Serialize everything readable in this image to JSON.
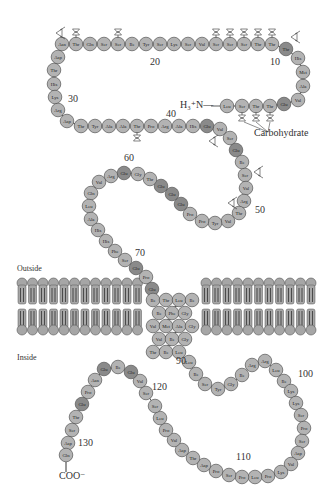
{
  "labels": {
    "outside": "Outside",
    "inside": "Inside",
    "n_terminus": "H₃⁺N—",
    "c_terminus": "COO⁻",
    "carbohydrate": "Carbohydrate"
  },
  "numbers": [
    {
      "text": "10",
      "x": 270,
      "y": 62
    },
    {
      "text": "20",
      "x": 150,
      "y": 62
    },
    {
      "text": "30",
      "x": 68,
      "y": 99
    },
    {
      "text": "40",
      "x": 166,
      "y": 114
    },
    {
      "text": "50",
      "x": 255,
      "y": 210
    },
    {
      "text": "60",
      "x": 124,
      "y": 158
    },
    {
      "text": "70",
      "x": 135,
      "y": 253
    },
    {
      "text": "90",
      "x": 176,
      "y": 361
    },
    {
      "text": "100",
      "x": 298,
      "y": 374
    },
    {
      "text": "110",
      "x": 236,
      "y": 457
    },
    {
      "text": "120",
      "x": 152,
      "y": 387
    },
    {
      "text": "130",
      "x": 78,
      "y": 443
    }
  ],
  "colors": {
    "residue_fill": "#b3b3b3",
    "residue_fill_dark": "#8a8a8a",
    "residue_stroke": "#555555",
    "lipid_fill": "#a6a6a6",
    "text": "#333333"
  },
  "residues": [
    {
      "n": 1,
      "aa": "Leu",
      "x": 227,
      "y": 106
    },
    {
      "n": 2,
      "aa": "Ser",
      "x": 242,
      "y": 106
    },
    {
      "n": 3,
      "aa": "Thr",
      "x": 256,
      "y": 106
    },
    {
      "n": 4,
      "aa": "Thr",
      "x": 270,
      "y": 106
    },
    {
      "n": 5,
      "aa": "Glu",
      "x": 284,
      "y": 104
    },
    {
      "n": 6,
      "aa": "Val",
      "x": 298,
      "y": 100
    },
    {
      "n": 7,
      "aa": "Ala",
      "x": 303,
      "y": 86
    },
    {
      "n": 8,
      "aa": "Met",
      "x": 303,
      "y": 72
    },
    {
      "n": 9,
      "aa": "His",
      "x": 298,
      "y": 58
    },
    {
      "n": 10,
      "aa": "Thr",
      "x": 286,
      "y": 49
    },
    {
      "n": 11,
      "aa": "Thr",
      "x": 272,
      "y": 44
    },
    {
      "n": 12,
      "aa": "Thr",
      "x": 258,
      "y": 44
    },
    {
      "n": 13,
      "aa": "Ser",
      "x": 244,
      "y": 44
    },
    {
      "n": 14,
      "aa": "Ser",
      "x": 230,
      "y": 44
    },
    {
      "n": 15,
      "aa": "Ser",
      "x": 216,
      "y": 44
    },
    {
      "n": 16,
      "aa": "Val",
      "x": 202,
      "y": 44
    },
    {
      "n": 17,
      "aa": "Ser",
      "x": 188,
      "y": 44
    },
    {
      "n": 18,
      "aa": "Lys",
      "x": 174,
      "y": 44
    },
    {
      "n": 19,
      "aa": "Ser",
      "x": 160,
      "y": 44
    },
    {
      "n": 20,
      "aa": "Tyr",
      "x": 146,
      "y": 44
    },
    {
      "n": 21,
      "aa": "Ile",
      "x": 132,
      "y": 44
    },
    {
      "n": 22,
      "aa": "Ser",
      "x": 118,
      "y": 44
    },
    {
      "n": 23,
      "aa": "Ser",
      "x": 104,
      "y": 44
    },
    {
      "n": 24,
      "aa": "Gln",
      "x": 90,
      "y": 44
    },
    {
      "n": 25,
      "aa": "Thr",
      "x": 76,
      "y": 44
    },
    {
      "n": 26,
      "aa": "Asn",
      "x": 62,
      "y": 44
    },
    {
      "n": 27,
      "aa": "Asp",
      "x": 58,
      "y": 57
    },
    {
      "n": 28,
      "aa": "Thr",
      "x": 54,
      "y": 70
    },
    {
      "n": 29,
      "aa": "His",
      "x": 54,
      "y": 84
    },
    {
      "n": 30,
      "aa": "Lys",
      "x": 55,
      "y": 97
    },
    {
      "n": 31,
      "aa": "Arg",
      "x": 58,
      "y": 110
    },
    {
      "n": 32,
      "aa": "Asp",
      "x": 67,
      "y": 121
    },
    {
      "n": 33,
      "aa": "Thr",
      "x": 81,
      "y": 126
    },
    {
      "n": 34,
      "aa": "Tyr",
      "x": 95,
      "y": 126
    },
    {
      "n": 35,
      "aa": "Ala",
      "x": 109,
      "y": 126
    },
    {
      "n": 36,
      "aa": "Ala",
      "x": 123,
      "y": 126
    },
    {
      "n": 37,
      "aa": "Thr",
      "x": 137,
      "y": 126
    },
    {
      "n": 38,
      "aa": "Pro",
      "x": 151,
      "y": 126
    },
    {
      "n": 39,
      "aa": "Arg",
      "x": 165,
      "y": 126
    },
    {
      "n": 40,
      "aa": "Ala",
      "x": 179,
      "y": 126
    },
    {
      "n": 41,
      "aa": "His",
      "x": 193,
      "y": 126
    },
    {
      "n": 42,
      "aa": "Glu",
      "x": 207,
      "y": 126
    },
    {
      "n": 43,
      "aa": "Val",
      "x": 220,
      "y": 129
    },
    {
      "n": 44,
      "aa": "Ser",
      "x": 230,
      "y": 138
    },
    {
      "n": 45,
      "aa": "Glu",
      "x": 236,
      "y": 150
    },
    {
      "n": 46,
      "aa": "Ile",
      "x": 242,
      "y": 162
    },
    {
      "n": 47,
      "aa": "Ser",
      "x": 245,
      "y": 175
    },
    {
      "n": 48,
      "aa": "Val",
      "x": 246,
      "y": 188
    },
    {
      "n": 49,
      "aa": "Arg",
      "x": 244,
      "y": 201
    },
    {
      "n": 50,
      "aa": "Thr",
      "x": 239,
      "y": 213
    },
    {
      "n": 51,
      "aa": "Val",
      "x": 228,
      "y": 221
    },
    {
      "n": 52,
      "aa": "Tyr",
      "x": 215,
      "y": 223
    },
    {
      "n": 53,
      "aa": "Pro",
      "x": 202,
      "y": 221
    },
    {
      "n": 54,
      "aa": "Pro",
      "x": 190,
      "y": 214
    },
    {
      "n": 55,
      "aa": "Glu",
      "x": 181,
      "y": 204
    },
    {
      "n": 56,
      "aa": "Glu",
      "x": 172,
      "y": 194
    },
    {
      "n": 57,
      "aa": "Glu",
      "x": 161,
      "y": 186
    },
    {
      "n": 58,
      "aa": "Thr",
      "x": 150,
      "y": 179
    },
    {
      "n": 59,
      "aa": "Gly",
      "x": 138,
      "y": 174
    },
    {
      "n": 60,
      "aa": "Glu",
      "x": 124,
      "y": 173
    },
    {
      "n": 61,
      "aa": "Arg",
      "x": 111,
      "y": 176
    },
    {
      "n": 62,
      "aa": "Val",
      "x": 99,
      "y": 182
    },
    {
      "n": 63,
      "aa": "Gln",
      "x": 91,
      "y": 193
    },
    {
      "n": 64,
      "aa": "Leu",
      "x": 89,
      "y": 206
    },
    {
      "n": 65,
      "aa": "Ala",
      "x": 91,
      "y": 219
    },
    {
      "n": 66,
      "aa": "His",
      "x": 98,
      "y": 230
    },
    {
      "n": 67,
      "aa": "His",
      "x": 106,
      "y": 241
    },
    {
      "n": 68,
      "aa": "Phe",
      "x": 115,
      "y": 251
    },
    {
      "n": 69,
      "aa": "Ser",
      "x": 125,
      "y": 260
    },
    {
      "n": 70,
      "aa": "Glu",
      "x": 136,
      "y": 268
    },
    {
      "n": 71,
      "aa": "Pro",
      "x": 146,
      "y": 277
    },
    {
      "n": 72,
      "aa": "Glu",
      "x": 152,
      "y": 289
    },
    {
      "n": 73,
      "aa": "Ile",
      "x": 153,
      "y": 300
    },
    {
      "n": 74,
      "aa": "Thr",
      "x": 166,
      "y": 300
    },
    {
      "n": 75,
      "aa": "Leu",
      "x": 179,
      "y": 300
    },
    {
      "n": 76,
      "aa": "Ile",
      "x": 192,
      "y": 300
    },
    {
      "n": 77,
      "aa": "Ile",
      "x": 159,
      "y": 313
    },
    {
      "n": 78,
      "aa": "Phe",
      "x": 172,
      "y": 313
    },
    {
      "n": 79,
      "aa": "Gly",
      "x": 185,
      "y": 313
    },
    {
      "n": 80,
      "aa": "Val",
      "x": 153,
      "y": 326
    },
    {
      "n": 81,
      "aa": "Met",
      "x": 166,
      "y": 326
    },
    {
      "n": 82,
      "aa": "Ala",
      "x": 179,
      "y": 326
    },
    {
      "n": 83,
      "aa": "Gly",
      "x": 192,
      "y": 326
    },
    {
      "n": 84,
      "aa": "Val",
      "x": 159,
      "y": 339
    },
    {
      "n": 85,
      "aa": "Ile",
      "x": 172,
      "y": 339
    },
    {
      "n": 86,
      "aa": "Gly",
      "x": 185,
      "y": 339
    },
    {
      "n": 87,
      "aa": "Thr",
      "x": 153,
      "y": 352
    },
    {
      "n": 88,
      "aa": "Ile",
      "x": 166,
      "y": 352
    },
    {
      "n": 89,
      "aa": "Leu",
      "x": 179,
      "y": 352
    },
    {
      "n": 90,
      "aa": "Leu",
      "x": 189,
      "y": 362
    },
    {
      "n": 91,
      "aa": "Ile",
      "x": 196,
      "y": 374
    },
    {
      "n": 92,
      "aa": "Ser",
      "x": 205,
      "y": 384
    },
    {
      "n": 93,
      "aa": "Tyr",
      "x": 218,
      "y": 389
    },
    {
      "n": 94,
      "aa": "Gly",
      "x": 231,
      "y": 384
    },
    {
      "n": 95,
      "aa": "Ile",
      "x": 242,
      "y": 375
    },
    {
      "n": 96,
      "aa": "Arg",
      "x": 252,
      "y": 365
    },
    {
      "n": 97,
      "aa": "Arg",
      "x": 265,
      "y": 361
    },
    {
      "n": 98,
      "aa": "Leu",
      "x": 276,
      "y": 370
    },
    {
      "n": 99,
      "aa": "Ile",
      "x": 284,
      "y": 381
    },
    {
      "n": 100,
      "aa": "Lys",
      "x": 291,
      "y": 391
    },
    {
      "n": 101,
      "aa": "Lys",
      "x": 296,
      "y": 403
    },
    {
      "n": 102,
      "aa": "Ser",
      "x": 301,
      "y": 415
    },
    {
      "n": 103,
      "aa": "Pro",
      "x": 304,
      "y": 428
    },
    {
      "n": 104,
      "aa": "Ser",
      "x": 302,
      "y": 441
    },
    {
      "n": 105,
      "aa": "Asp",
      "x": 298,
      "y": 453
    },
    {
      "n": 106,
      "aa": "Val",
      "x": 291,
      "y": 464
    },
    {
      "n": 107,
      "aa": "Lys",
      "x": 281,
      "y": 472
    },
    {
      "n": 108,
      "aa": "Pro",
      "x": 268,
      "y": 476
    },
    {
      "n": 109,
      "aa": "Leu",
      "x": 255,
      "y": 477
    },
    {
      "n": 110,
      "aa": "Pro",
      "x": 242,
      "y": 477
    },
    {
      "n": 111,
      "aa": "Ser",
      "x": 229,
      "y": 475
    },
    {
      "n": 112,
      "aa": "Pro",
      "x": 216,
      "y": 471
    },
    {
      "n": 113,
      "aa": "Asp",
      "x": 204,
      "y": 465
    },
    {
      "n": 114,
      "aa": "Thr",
      "x": 193,
      "y": 458
    },
    {
      "n": 115,
      "aa": "Asp",
      "x": 182,
      "y": 450
    },
    {
      "n": 116,
      "aa": "Val",
      "x": 174,
      "y": 440
    },
    {
      "n": 117,
      "aa": "Pro",
      "x": 166,
      "y": 430
    },
    {
      "n": 118,
      "aa": "Leu",
      "x": 160,
      "y": 418
    },
    {
      "n": 119,
      "aa": "Ser",
      "x": 155,
      "y": 406
    },
    {
      "n": 120,
      "aa": "Ser",
      "x": 146,
      "y": 393
    },
    {
      "n": 121,
      "aa": "Val",
      "x": 140,
      "y": 381
    },
    {
      "n": 122,
      "aa": "Glu",
      "x": 131,
      "y": 372
    },
    {
      "n": 123,
      "aa": "Ile",
      "x": 118,
      "y": 367
    },
    {
      "n": 124,
      "aa": "Glu",
      "x": 104,
      "y": 369
    },
    {
      "n": 125,
      "aa": "Asn",
      "x": 95,
      "y": 380
    },
    {
      "n": 126,
      "aa": "Pro",
      "x": 88,
      "y": 392
    },
    {
      "n": 127,
      "aa": "Glu",
      "x": 82,
      "y": 404
    },
    {
      "n": 128,
      "aa": "Thr",
      "x": 76,
      "y": 417
    },
    {
      "n": 129,
      "aa": "Ser",
      "x": 72,
      "y": 430
    },
    {
      "n": 130,
      "aa": "Asp",
      "x": 68,
      "y": 443
    },
    {
      "n": 131,
      "aa": "Gln",
      "x": 66,
      "y": 455
    }
  ],
  "dark_residues": [
    5,
    10,
    42,
    45,
    55,
    56,
    57,
    60,
    70,
    72,
    122,
    124,
    127
  ],
  "glycans_o_top": [
    11,
    12,
    13,
    14,
    15,
    25,
    22
  ],
  "glycans_o_bottom": [
    2,
    3,
    4,
    37
  ],
  "glycans_n": [
    {
      "x": 60,
      "y": 33
    },
    {
      "x": 295,
      "y": 37
    },
    {
      "x": 213,
      "y": 141
    },
    {
      "x": 258,
      "y": 172
    },
    {
      "x": 232,
      "y": 203
    }
  ]
}
